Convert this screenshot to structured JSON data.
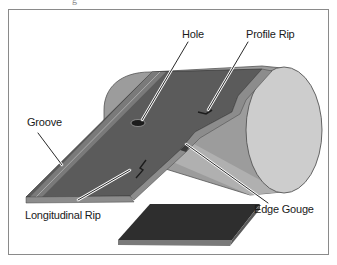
{
  "figure": {
    "title_fragment": "g",
    "labels": {
      "hole": "Hole",
      "profile_rip": "Profile Rip",
      "groove": "Groove",
      "longitudinal_rip": "Longitudinal Rip",
      "edge_gouge": "Edge Gouge"
    },
    "colors": {
      "belt_top": "#5a5a5a",
      "belt_edge": "#8c8c8c",
      "drum_body": "#9a9a9a",
      "drum_end": "#c8c8c8",
      "pad": "#2e2e2e",
      "frame": "#8a8a8a"
    }
  }
}
